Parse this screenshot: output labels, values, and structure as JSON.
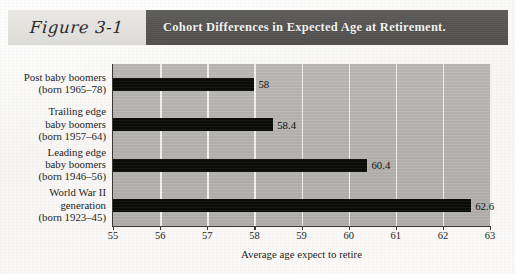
{
  "figure": {
    "label": "Figure 3-1",
    "title": "Cohort Differences in Expected Age at Retirement."
  },
  "chart_data": {
    "type": "bar",
    "orientation": "horizontal",
    "title": "Cohort Differences in Expected Age at Retirement.",
    "xlabel": "Average age expect to retire",
    "ylabel": "",
    "xlim": [
      55,
      63
    ],
    "ylim": null,
    "grid": true,
    "legend": null,
    "xticks": [
      "55",
      "56",
      "57",
      "58",
      "59",
      "60",
      "61",
      "62",
      "63"
    ],
    "categories": [
      "Post baby boomers\n(born 1965–78)",
      "Trailing edge\nbaby boomers\n(born 1957–64)",
      "Leading edge\nbaby boomers\n(born 1946–56)",
      "World War II\ngeneration\n(born 1923–45)"
    ],
    "values": [
      58,
      58.4,
      60.4,
      62.6
    ],
    "data_labels": [
      "58",
      "58.4",
      "60.4",
      "62.6"
    ],
    "bar_color": "#0b0b0a",
    "plot_background": "#b5b4b2",
    "gridline_color": "#f2f1ef"
  },
  "categories": [
    {
      "lines": [
        "Post baby boomers",
        "(born 1965–78)"
      ],
      "value": 58,
      "value_label": "58"
    },
    {
      "lines": [
        "Trailing edge",
        "baby boomers",
        "(born 1957–64)"
      ],
      "value": 58.4,
      "value_label": "58.4"
    },
    {
      "lines": [
        "Leading edge",
        "baby boomers",
        "(born 1946–56)"
      ],
      "value": 60.4,
      "value_label": "60.4"
    },
    {
      "lines": [
        "World War II",
        "generation",
        "(born 1923–45)"
      ],
      "value": 62.6,
      "value_label": "62.6"
    }
  ],
  "axis": {
    "x_title": "Average age expect to retire",
    "ticks": [
      "55",
      "56",
      "57",
      "58",
      "59",
      "60",
      "61",
      "62",
      "63"
    ]
  },
  "colors": {
    "band_dark": "#565553",
    "band_light": "#e3e2de",
    "bar": "#0b0b0a",
    "plot_bg": "#b5b4b2",
    "grid": "#f2f1ef",
    "title_text": "#f4f3f1",
    "body_text": "#1f1e1d"
  }
}
